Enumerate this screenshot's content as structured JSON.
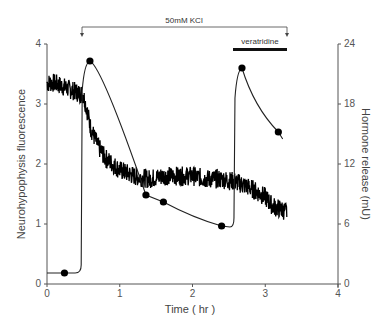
{
  "chart_data": {
    "type": "line",
    "title": "",
    "xlabel": "Time ( hr )",
    "ylabel_left": "Neurohypophysis fluorescence",
    "ylabel_right": "Hormone release (mU)",
    "xlim": [
      0,
      4
    ],
    "ylim_left": [
      0,
      4
    ],
    "ylim_right": [
      0,
      24
    ],
    "x_ticks": [
      "0",
      "1",
      "2",
      "3",
      "4"
    ],
    "y_left_ticks": [
      "0",
      "1",
      "2",
      "3",
      "4"
    ],
    "y_right_ticks": [
      "0",
      "6",
      "12",
      "18",
      "24"
    ],
    "grid": false,
    "legend": null,
    "annotations": [
      {
        "text": "50mM KCl",
        "type": "bracket",
        "x_start": 0.48,
        "x_end": 3.3
      },
      {
        "text": "veratridine",
        "type": "bar",
        "x_start": 2.56,
        "x_end": 3.3
      }
    ],
    "series": [
      {
        "name": "Neurohypophysis fluorescence",
        "axis": "left",
        "style": "noisy-trace",
        "x": [
          0.0,
          0.1,
          0.2,
          0.3,
          0.4,
          0.5,
          0.55,
          0.6,
          0.7,
          0.8,
          0.9,
          1.0,
          1.1,
          1.2,
          1.4,
          1.6,
          1.8,
          2.0,
          2.2,
          2.4,
          2.6,
          2.8,
          3.0,
          3.1,
          3.2,
          3.3
        ],
        "values": [
          3.35,
          3.35,
          3.3,
          3.25,
          3.2,
          3.15,
          2.9,
          2.6,
          2.3,
          2.1,
          2.0,
          1.9,
          1.85,
          1.8,
          1.75,
          1.8,
          1.8,
          1.8,
          1.75,
          1.75,
          1.7,
          1.6,
          1.45,
          1.3,
          1.25,
          1.2
        ]
      },
      {
        "name": "Hormone release",
        "axis": "right",
        "style": "line-with-markers",
        "x": [
          0.0,
          0.24,
          0.47,
          0.59,
          1.36,
          1.6,
          2.4,
          2.57,
          2.68,
          3.18,
          3.24
        ],
        "values": [
          1.1,
          1.1,
          2.0,
          22.3,
          8.9,
          8.2,
          5.8,
          6.0,
          21.6,
          15.2,
          14.5
        ],
        "markers": [
          {
            "x": 0.24,
            "y": 1.1
          },
          {
            "x": 0.59,
            "y": 22.3
          },
          {
            "x": 1.36,
            "y": 8.9
          },
          {
            "x": 1.6,
            "y": 8.2
          },
          {
            "x": 2.4,
            "y": 5.8
          },
          {
            "x": 2.68,
            "y": 21.6
          },
          {
            "x": 3.18,
            "y": 15.2
          }
        ]
      }
    ]
  }
}
